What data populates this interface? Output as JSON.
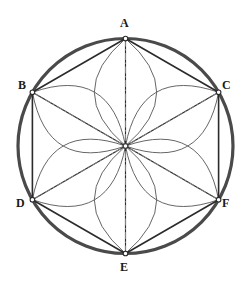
{
  "figure": {
    "background_color": "#ffffff",
    "width": 252,
    "height": 292
  },
  "colors": {
    "circle_stroke": "#4a4a4a",
    "hexagon_stroke": "#2b2b2b",
    "petal_stroke": "#555555",
    "axis_stroke": "#8a8a8a",
    "label_color": "#1a1a1a",
    "vertex_fill": "#ffffff"
  },
  "geometry": {
    "circle": {
      "center_x": 125.5,
      "center_y": 146.0,
      "radius": 107.5,
      "stroke_width": 3.2
    },
    "center_point": {
      "label": "O",
      "x": 125.5,
      "y": 146.0,
      "visible_label": false
    },
    "hexagon": {
      "sides": 6,
      "stroke_width": 1.6,
      "orientation": "pointy-top",
      "vertex_angles_deg": [
        90,
        150,
        30,
        210,
        330,
        270
      ]
    },
    "petals": {
      "count": 6,
      "stroke_width": 0.9,
      "centerline_style": "dash-dot",
      "centerline_stroke_width": 0.9,
      "half_width_ratio": 0.29,
      "description": "Each petal is a lens (vesica) from the circle centre out to a hexagon vertex, with a dash-dot axis line along its length."
    }
  },
  "vertices": [
    {
      "id": "A",
      "label": "A",
      "x": 125.5,
      "y": 38.5,
      "label_x": 121,
      "label_y": 18,
      "angle_deg": 90
    },
    {
      "id": "B",
      "label": "B",
      "x": 32.4,
      "y": 92.3,
      "label_x": 18,
      "label_y": 78,
      "angle_deg": 150
    },
    {
      "id": "C",
      "label": "C",
      "x": 218.6,
      "y": 92.3,
      "label_x": 221,
      "label_y": 78,
      "angle_deg": 30
    },
    {
      "id": "D",
      "label": "D",
      "x": 32.4,
      "y": 199.7,
      "label_x": 17,
      "label_y": 198,
      "angle_deg": 210
    },
    {
      "id": "F",
      "label": "F",
      "x": 218.6,
      "y": 199.7,
      "label_x": 221,
      "label_y": 198,
      "angle_deg": 330
    },
    {
      "id": "E",
      "label": "E",
      "x": 125.5,
      "y": 253.5,
      "label_x": 121,
      "label_y": 262,
      "angle_deg": 270
    }
  ],
  "hexagon_edges": [
    {
      "from": "A",
      "to": "B"
    },
    {
      "from": "B",
      "to": "D"
    },
    {
      "from": "D",
      "to": "E"
    },
    {
      "from": "E",
      "to": "F"
    },
    {
      "from": "F",
      "to": "C"
    },
    {
      "from": "C",
      "to": "A"
    }
  ],
  "radii": [
    {
      "from": "center",
      "to": "A"
    },
    {
      "from": "center",
      "to": "B"
    },
    {
      "from": "center",
      "to": "C"
    },
    {
      "from": "center",
      "to": "D"
    },
    {
      "from": "center",
      "to": "E"
    },
    {
      "from": "center",
      "to": "F"
    }
  ]
}
